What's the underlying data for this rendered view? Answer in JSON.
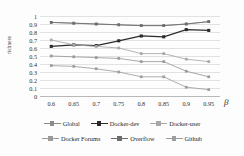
{
  "chart_data": {
    "type": "line",
    "title": "",
    "xlabel": "β",
    "ylabel": "richness",
    "x": [
      0.6,
      0.65,
      0.7,
      0.75,
      0.8,
      0.85,
      0.9,
      0.95
    ],
    "xtick_labels": [
      "0.6",
      "0.65",
      "0.7",
      "0.75",
      "0.8",
      "0.85",
      "0.9",
      "0.95"
    ],
    "ytick_labels": [
      "0",
      "0.1",
      "0.2",
      "0.3",
      "0.4",
      "0.5",
      "0.6",
      "0.7",
      "0.8",
      "0.9",
      "1"
    ],
    "ylim": [
      0,
      1
    ],
    "ytick_values": [
      0,
      0.1,
      0.2,
      0.3,
      0.4,
      0.5,
      0.6,
      0.7,
      0.8,
      0.9,
      1
    ],
    "grid": true,
    "grid_axis": "y",
    "legend_position": "bottom",
    "series": [
      {
        "name": "Global",
        "color": "#8c8c8c",
        "marker": "square",
        "values": [
          0.92,
          0.91,
          0.9,
          0.89,
          0.88,
          0.88,
          0.9,
          0.93
        ]
      },
      {
        "name": "Docker-dev",
        "color": "#2b2b2b",
        "marker": "square",
        "values": [
          0.62,
          0.64,
          0.63,
          0.69,
          0.75,
          0.74,
          0.83,
          0.82
        ]
      },
      {
        "name": "Docker-user",
        "color": "#a8a8a8",
        "marker": "square",
        "values": [
          0.7,
          0.64,
          0.62,
          0.6,
          0.53,
          0.53,
          0.46,
          0.43
        ]
      },
      {
        "name": "Docker Forums",
        "color": "#9a9a9a",
        "marker": "square",
        "values": [
          0.5,
          0.49,
          0.48,
          0.47,
          0.43,
          0.43,
          0.31,
          0.24
        ]
      },
      {
        "name": "Overflow",
        "color": "#6e6e6e",
        "marker": "square",
        "values": [
          0.92,
          0.91,
          0.9,
          0.89,
          0.88,
          0.88,
          0.9,
          0.93
        ]
      },
      {
        "name": "Github",
        "color": "#9e9e9e",
        "marker": "square",
        "values": [
          0.38,
          0.37,
          0.34,
          0.3,
          0.24,
          0.24,
          0.11,
          0.08
        ]
      }
    ],
    "legend_rows": [
      [
        "Global",
        "Docker-dev",
        "Docker-user"
      ],
      [
        "Docker Forums",
        "Overflow",
        "Github"
      ]
    ]
  }
}
